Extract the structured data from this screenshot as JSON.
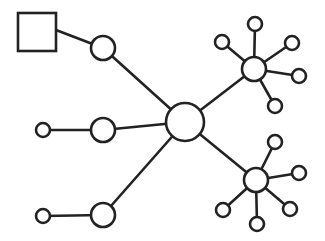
{
  "diagram": {
    "type": "network-topology",
    "width": 325,
    "height": 241,
    "colors": {
      "stroke": "#222222",
      "fill": "#ffffff",
      "background": "#ffffff"
    },
    "nodes": [
      {
        "id": "square",
        "shape": "square",
        "x": 18,
        "y": 13,
        "w": 38,
        "h": 38
      },
      {
        "id": "n-top",
        "shape": "circle",
        "cx": 103,
        "cy": 48,
        "r": 12
      },
      {
        "id": "n-mid",
        "shape": "circle",
        "cx": 103,
        "cy": 130,
        "r": 12
      },
      {
        "id": "n-bot",
        "shape": "circle",
        "cx": 103,
        "cy": 215,
        "r": 12
      },
      {
        "id": "leaf-mid",
        "shape": "circle",
        "cx": 43,
        "cy": 130,
        "r": 7
      },
      {
        "id": "leaf-bot",
        "shape": "circle",
        "cx": 43,
        "cy": 216,
        "r": 7
      },
      {
        "id": "center",
        "shape": "circle",
        "cx": 185,
        "cy": 122,
        "r": 19
      },
      {
        "id": "hub-top",
        "shape": "circle",
        "cx": 254,
        "cy": 69,
        "r": 12
      },
      {
        "id": "hub-bot",
        "shape": "circle",
        "cx": 256,
        "cy": 180,
        "r": 12
      },
      {
        "id": "ht-1",
        "shape": "circle",
        "cx": 222,
        "cy": 42,
        "r": 7
      },
      {
        "id": "ht-2",
        "shape": "circle",
        "cx": 255,
        "cy": 24,
        "r": 7
      },
      {
        "id": "ht-3",
        "shape": "circle",
        "cx": 292,
        "cy": 43,
        "r": 7
      },
      {
        "id": "ht-4",
        "shape": "circle",
        "cx": 299,
        "cy": 76,
        "r": 7
      },
      {
        "id": "ht-5",
        "shape": "circle",
        "cx": 275,
        "cy": 106,
        "r": 7
      },
      {
        "id": "hb-1",
        "shape": "circle",
        "cx": 275,
        "cy": 142,
        "r": 7
      },
      {
        "id": "hb-2",
        "shape": "circle",
        "cx": 299,
        "cy": 173,
        "r": 7
      },
      {
        "id": "hb-3",
        "shape": "circle",
        "cx": 290,
        "cy": 209,
        "r": 7
      },
      {
        "id": "hb-4",
        "shape": "circle",
        "cx": 257,
        "cy": 224,
        "r": 7
      },
      {
        "id": "hb-5",
        "shape": "circle",
        "cx": 223,
        "cy": 210,
        "r": 7
      }
    ],
    "edges": [
      {
        "from": "square",
        "to": "n-top",
        "x1": 56,
        "y1": 30,
        "x2": 103,
        "y2": 48
      },
      {
        "from": "n-top",
        "to": "center",
        "x1": 103,
        "y1": 48,
        "x2": 185,
        "y2": 122
      },
      {
        "from": "leaf-mid",
        "to": "n-mid",
        "x1": 43,
        "y1": 130,
        "x2": 103,
        "y2": 130
      },
      {
        "from": "n-mid",
        "to": "center",
        "x1": 103,
        "y1": 130,
        "x2": 185,
        "y2": 122
      },
      {
        "from": "leaf-bot",
        "to": "n-bot",
        "x1": 43,
        "y1": 216,
        "x2": 103,
        "y2": 215
      },
      {
        "from": "n-bot",
        "to": "center",
        "x1": 103,
        "y1": 215,
        "x2": 185,
        "y2": 122
      },
      {
        "from": "center",
        "to": "hub-top",
        "x1": 185,
        "y1": 122,
        "x2": 254,
        "y2": 69
      },
      {
        "from": "center",
        "to": "hub-bot",
        "x1": 185,
        "y1": 122,
        "x2": 256,
        "y2": 180
      },
      {
        "from": "hub-top",
        "to": "ht-1",
        "x1": 254,
        "y1": 69,
        "x2": 222,
        "y2": 42
      },
      {
        "from": "hub-top",
        "to": "ht-2",
        "x1": 254,
        "y1": 69,
        "x2": 255,
        "y2": 24
      },
      {
        "from": "hub-top",
        "to": "ht-3",
        "x1": 254,
        "y1": 69,
        "x2": 292,
        "y2": 43
      },
      {
        "from": "hub-top",
        "to": "ht-4",
        "x1": 254,
        "y1": 69,
        "x2": 299,
        "y2": 76
      },
      {
        "from": "hub-top",
        "to": "ht-5",
        "x1": 254,
        "y1": 69,
        "x2": 275,
        "y2": 106
      },
      {
        "from": "hub-bot",
        "to": "hb-1",
        "x1": 256,
        "y1": 180,
        "x2": 275,
        "y2": 142
      },
      {
        "from": "hub-bot",
        "to": "hb-2",
        "x1": 256,
        "y1": 180,
        "x2": 299,
        "y2": 173
      },
      {
        "from": "hub-bot",
        "to": "hb-3",
        "x1": 256,
        "y1": 180,
        "x2": 290,
        "y2": 209
      },
      {
        "from": "hub-bot",
        "to": "hb-4",
        "x1": 256,
        "y1": 180,
        "x2": 257,
        "y2": 224
      },
      {
        "from": "hub-bot",
        "to": "hb-5",
        "x1": 256,
        "y1": 180,
        "x2": 223,
        "y2": 210
      }
    ]
  }
}
